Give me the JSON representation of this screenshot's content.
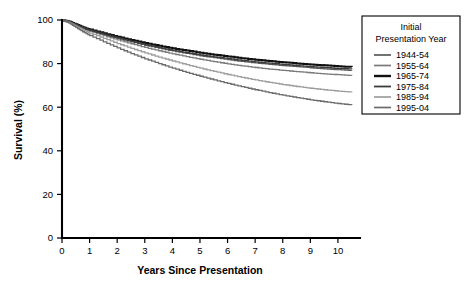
{
  "chart_data": {
    "type": "line",
    "title": "",
    "xlabel": "Years Since Presentation",
    "ylabel": "Survival (%)",
    "xlim": [
      0,
      10.8
    ],
    "ylim": [
      0,
      100
    ],
    "xticks": [
      0,
      1,
      2,
      3,
      4,
      5,
      6,
      7,
      8,
      9,
      10
    ],
    "yticks": [
      0,
      20,
      40,
      60,
      80,
      100
    ],
    "grid": false,
    "legend_position": "upper right",
    "legend_title_line1": "Initial",
    "legend_title_line2": "Presentation Year",
    "x": [
      0,
      0.25,
      0.5,
      0.75,
      1,
      1.5,
      2,
      2.5,
      3,
      3.5,
      4,
      4.5,
      5,
      5.5,
      6,
      6.5,
      7,
      7.5,
      8,
      8.5,
      9,
      9.5,
      10,
      10.5
    ],
    "series": [
      {
        "name": "1944-54",
        "color": "#5a5a5a",
        "width": 1.3,
        "values": [
          100,
          99.2,
          97.8,
          96.4,
          95.2,
          93.4,
          91.6,
          90.0,
          88.4,
          87.1,
          85.8,
          84.7,
          83.6,
          82.7,
          81.8,
          81.0,
          80.3,
          79.7,
          79.1,
          78.6,
          78.1,
          77.6,
          77.2,
          76.8
        ]
      },
      {
        "name": "1955-64",
        "color": "#7a7a7a",
        "width": 1.3,
        "values": [
          100,
          99.1,
          97.6,
          96.1,
          94.8,
          92.8,
          90.9,
          89.1,
          87.4,
          85.9,
          84.5,
          83.2,
          82.0,
          80.9,
          79.9,
          79.0,
          78.2,
          77.5,
          76.9,
          76.3,
          75.8,
          75.3,
          74.9,
          74.5
        ]
      },
      {
        "name": "1965-74",
        "color": "#111111",
        "width": 2.0,
        "values": [
          100,
          99.3,
          98.0,
          96.7,
          95.6,
          93.9,
          92.3,
          90.8,
          89.4,
          88.2,
          87.0,
          86.0,
          85.0,
          84.1,
          83.3,
          82.5,
          81.8,
          81.2,
          80.6,
          80.1,
          79.6,
          79.2,
          78.8,
          78.4
        ]
      },
      {
        "name": "1975-84",
        "color": "#3c3c3c",
        "width": 1.4,
        "values": [
          100,
          99.2,
          97.9,
          96.5,
          95.3,
          93.5,
          91.8,
          90.2,
          88.7,
          87.4,
          86.1,
          85.0,
          84.0,
          83.1,
          82.3,
          81.5,
          80.8,
          80.2,
          79.6,
          79.1,
          78.6,
          78.2,
          77.8,
          77.5
        ]
      },
      {
        "name": "1985-94",
        "color": "#9d9d9d",
        "width": 1.3,
        "values": [
          100,
          98.9,
          97.2,
          95.5,
          94.0,
          91.6,
          89.2,
          87.0,
          84.9,
          83.0,
          81.2,
          79.5,
          77.9,
          76.4,
          75.0,
          73.7,
          72.5,
          71.4,
          70.4,
          69.5,
          68.7,
          68.0,
          67.4,
          66.9
        ]
      },
      {
        "name": "1995-04",
        "color": "#6b6b6b",
        "width": 1.3,
        "values": [
          100,
          98.6,
          96.6,
          94.6,
          92.9,
          90.0,
          87.2,
          84.6,
          82.2,
          80.0,
          77.9,
          76.0,
          74.2,
          72.5,
          70.9,
          69.4,
          68.0,
          66.7,
          65.5,
          64.4,
          63.4,
          62.5,
          61.7,
          61.0
        ]
      }
    ]
  }
}
